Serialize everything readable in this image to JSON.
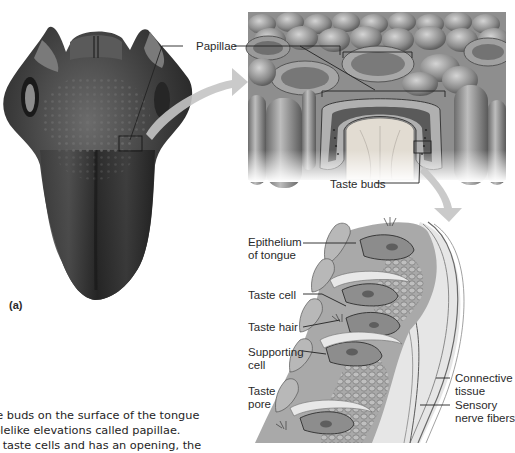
{
  "figure": {
    "panel_a_label": "(a)",
    "labels": {
      "papillae": "Papillae",
      "taste_buds": "Taste buds",
      "epithelium_line1": "Epithelium",
      "epithelium_line2": "of tongue",
      "taste_cell": "Taste cell",
      "taste_hair": "Taste hair",
      "supporting_line1": "Supporting",
      "supporting_line2": "cell",
      "taste_pore_line1": "Taste",
      "taste_pore_line2": "pore",
      "connective_line1": "Connective",
      "connective_line2": "tissue",
      "sensory_line1": "Sensory",
      "sensory_line2": "nerve fibers"
    },
    "caption_lines": [
      "ste buds on the surface of the tongue",
      "pplelike elevations called papillae.",
      "ns taste cells and has an opening, the"
    ],
    "colors": {
      "tongue_dark": "#2b2b2b",
      "tongue_mid": "#5a5a5a",
      "arrow_gray": "#bdbdbd",
      "leader_line": "#333333",
      "tissue_light": "#d8d8d8"
    }
  }
}
